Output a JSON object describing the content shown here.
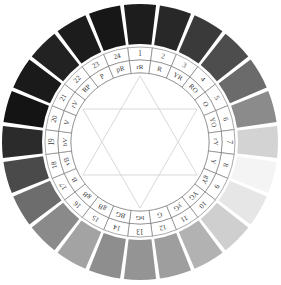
{
  "figure": {
    "name": "grayscale-color-wheel",
    "background": "#ffffff",
    "center_fill": "#ffffff",
    "ring_line_color": "#6e6e6e",
    "star_line_color": "#cfcfcf",
    "gap_color": "#ffffff",
    "label_color": "#3a3a3a"
  },
  "geometry": {
    "cx": 140,
    "cy": 142,
    "outer_r": 138,
    "outer_inner_r": 98,
    "num_ring_outer_r": 95,
    "num_ring_inner_r": 82,
    "hue_ring_outer_r": 82,
    "hue_ring_inner_r": 69,
    "center_r": 69,
    "segments": 24,
    "start_angle_deg": -97.5,
    "segment_span_deg": 15,
    "gap_deg": 1.6
  },
  "wheel": {
    "segment_count": 24,
    "numbers": [
      "1",
      "2",
      "3",
      "4",
      "5",
      "6",
      "7",
      "8",
      "9",
      "10",
      "11",
      "12",
      "13",
      "14",
      "15",
      "16",
      "17",
      "18",
      "19",
      "20",
      "21",
      "22",
      "23",
      "24"
    ],
    "hue_labels": [
      "rR",
      "R",
      "YR",
      "RO",
      "O",
      "YO",
      "rY",
      "Y",
      "gY",
      "YG",
      "yG",
      "G",
      "bG",
      "BG",
      "gB",
      "gB",
      "B",
      "vB",
      "bV",
      "V",
      "rV",
      "RP",
      "P",
      "pR"
    ],
    "swatch_grays": [
      "#1d1d1d",
      "#282828",
      "#3a3a3a",
      "#4d4d4d",
      "#6b6b6b",
      "#8b8b8b",
      "#d3d3d3",
      "#f4f4f4",
      "#e6e6e6",
      "#cfcfcf",
      "#b2b2b2",
      "#9e9e9e",
      "#949494",
      "#8e8e8e",
      "#a3a3a3",
      "#8a8a8a",
      "#6d6d6d",
      "#4a4a4a",
      "#2b2b2b",
      "#141414",
      "#1a1a1a",
      "#222222",
      "#1c1c1c",
      "#171717"
    ]
  },
  "chart_data": {
    "type": "pie",
    "xlabel": "",
    "ylabel": "",
    "categories": [
      "1 rR",
      "2 R",
      "3 YR",
      "4 RO",
      "5 O",
      "6 YO",
      "7 rY",
      "8 Y",
      "9 gY",
      "10 YG",
      "11 yG",
      "12 G",
      "13 bG",
      "14 BG",
      "15 gB",
      "16 gB",
      "17 B",
      "18 vB",
      "19 bV",
      "20 V",
      "21 rV",
      "22 RP",
      "23 P",
      "24 pR"
    ],
    "values": [
      15,
      15,
      15,
      15,
      15,
      15,
      15,
      15,
      15,
      15,
      15,
      15,
      15,
      15,
      15,
      15,
      15,
      15,
      15,
      15,
      15,
      15,
      15,
      15
    ],
    "colors": [
      "#1d1d1d",
      "#282828",
      "#3a3a3a",
      "#4d4d4d",
      "#6b6b6b",
      "#8b8b8b",
      "#d3d3d3",
      "#f4f4f4",
      "#e6e6e6",
      "#cfcfcf",
      "#b2b2b2",
      "#9e9e9e",
      "#949494",
      "#8e8e8e",
      "#a3a3a3",
      "#8a8a8a",
      "#6d6d6d",
      "#4a4a4a",
      "#2b2b2b",
      "#141414",
      "#1a1a1a",
      "#222222",
      "#1c1c1c",
      "#171717"
    ],
    "legend": "none",
    "grid": false
  },
  "star": {
    "name": "hexagram",
    "triangle_up_vertices_deg": [
      -90,
      30,
      150
    ],
    "triangle_down_vertices_deg": [
      90,
      -30,
      -150
    ],
    "radius": 66
  }
}
